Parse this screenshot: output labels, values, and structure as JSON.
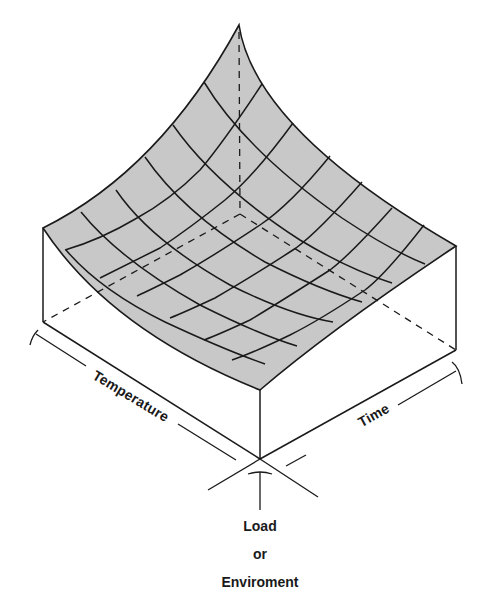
{
  "diagram": {
    "type": "3d-surface-block",
    "surface_fill": "#c8c8c8",
    "line_color": "#1a1a1a",
    "axes": {
      "left": "Temperature",
      "right": "Time",
      "vertical": [
        "Load",
        "or",
        "Enviroment"
      ]
    }
  }
}
